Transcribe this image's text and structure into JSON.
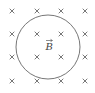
{
  "diagram": {
    "field_label": "B",
    "field_symbol": "×",
    "grid": {
      "cols_x": [
        12,
        37,
        61,
        85
      ],
      "rows_y": [
        11,
        34,
        57,
        81
      ]
    },
    "circle": {
      "cx": 48,
      "cy": 47,
      "r": 32,
      "stroke": "#666666"
    },
    "colors": {
      "marks": "#555555",
      "background": "#ffffff"
    }
  }
}
